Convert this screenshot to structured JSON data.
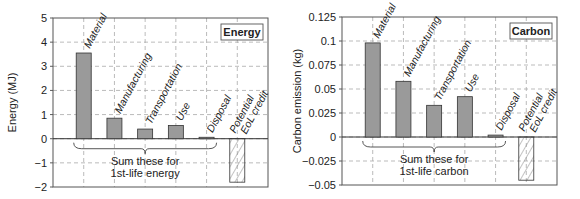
{
  "chart_data": [
    {
      "type": "bar",
      "title": "Energy",
      "ylabel": "Energy (MJ)",
      "xlabel": "",
      "categories": [
        "Material",
        "Manufacturing",
        "Transportation",
        "Use",
        "Disposal",
        "Potential EoL credit"
      ],
      "values": [
        3.55,
        0.85,
        0.4,
        0.55,
        0.06,
        -1.8
      ],
      "ylim": [
        -2,
        5
      ],
      "yticks": [
        "5",
        "4",
        "3",
        "2",
        "1",
        "0",
        "−1",
        "−2"
      ],
      "grid": true,
      "legend_box": "Energy",
      "annotation": [
        "Sum these for",
        "1st-life energy"
      ],
      "eol_label": [
        "Potential",
        "EoL credit"
      ]
    },
    {
      "type": "bar",
      "title": "Carbon",
      "ylabel": "Carbon emission (kg)",
      "xlabel": "",
      "categories": [
        "Material",
        "Manufacturing",
        "Transportation",
        "Use",
        "Disposal",
        "Potential EoL credit"
      ],
      "values": [
        0.098,
        0.058,
        0.033,
        0.042,
        0.002,
        -0.045
      ],
      "ylim": [
        -0.05,
        0.125
      ],
      "yticks": [
        "0.125",
        "0.1",
        "0.075",
        "0.05",
        "0.025",
        "0",
        "−0.025",
        "−0.05"
      ],
      "grid": true,
      "legend_box": "Carbon",
      "annotation": [
        "Sum these for",
        "1st-life carbon"
      ],
      "eol_label": [
        "Potential",
        "EoL credit"
      ]
    }
  ],
  "colors": {
    "bar_fill": "#9a9a9a",
    "bar_stroke": "#333333",
    "grid": "#aaaaaa",
    "hatch": "#888888"
  }
}
